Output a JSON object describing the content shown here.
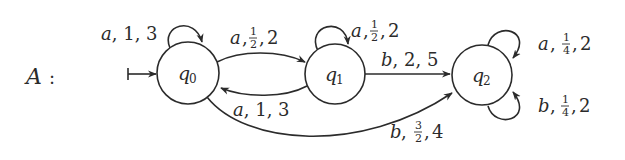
{
  "automaton": {
    "name": "A",
    "name_suffix": ":",
    "states": [
      {
        "id": "q0",
        "letter": "q",
        "index": "0",
        "initial": true
      },
      {
        "id": "q1",
        "letter": "q",
        "index": "1",
        "initial": false
      },
      {
        "id": "q2",
        "letter": "q",
        "index": "2",
        "initial": false
      }
    ],
    "transitions": [
      {
        "from": "q0",
        "to": "q0",
        "symbol": "a",
        "weight": "1",
        "cost": "3",
        "label": {
          "symbol": "a",
          "sep1": ", ",
          "weight": "1",
          "sep2": ", ",
          "cost": "3"
        }
      },
      {
        "from": "q0",
        "to": "q1",
        "symbol": "a",
        "weight": "1/2",
        "cost": "2",
        "label": {
          "symbol": "a",
          "sep1": ",",
          "num": "1",
          "den": "2",
          "sep2": ",",
          "cost": "2"
        }
      },
      {
        "from": "q1",
        "to": "q1",
        "symbol": "a",
        "weight": "1/2",
        "cost": "2",
        "label": {
          "symbol": "a",
          "sep1": ",",
          "num": "1",
          "den": "2",
          "sep2": ",",
          "cost": "2"
        }
      },
      {
        "from": "q1",
        "to": "q0",
        "symbol": "a",
        "weight": "1",
        "cost": "3",
        "label": {
          "symbol": "a",
          "sep1": ", ",
          "weight": "1",
          "sep2": ", ",
          "cost": "3"
        }
      },
      {
        "from": "q1",
        "to": "q2",
        "symbol": "b",
        "weight": "2",
        "cost": "5",
        "label": {
          "symbol": "b",
          "sep1": ", ",
          "weight": "2",
          "sep2": ", ",
          "cost": "5"
        }
      },
      {
        "from": "q0",
        "to": "q2",
        "symbol": "b",
        "weight": "3/2",
        "cost": "4",
        "label": {
          "symbol": "b",
          "sep1": ",",
          "num": "3",
          "den": "2",
          "sep2": ",",
          "cost": "4"
        }
      },
      {
        "from": "q2",
        "to": "q2",
        "symbol": "a",
        "weight": "1/4",
        "cost": "2",
        "label": {
          "symbol": "a",
          "sep1": ",",
          "num": "1",
          "den": "4",
          "sep2": ",",
          "cost": "2"
        }
      },
      {
        "from": "q2",
        "to": "q2",
        "symbol": "b",
        "weight": "1/4",
        "cost": "2",
        "label": {
          "symbol": "b",
          "sep1": ",",
          "num": "1",
          "den": "4",
          "sep2": ",",
          "cost": "2"
        }
      }
    ]
  },
  "colors": {
    "ink": "#2b2b2b",
    "background": "#ffffff"
  }
}
